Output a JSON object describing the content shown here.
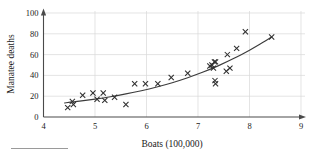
{
  "chart_data": {
    "type": "scatter",
    "title": "",
    "xlabel": "Boats (100,000)",
    "ylabel": "Manatee deaths",
    "xlim": [
      4,
      9
    ],
    "ylim": [
      0,
      100
    ],
    "xticks": [
      4,
      5,
      6,
      7,
      8,
      9
    ],
    "yticks": [
      0,
      20,
      40,
      60,
      80,
      100
    ],
    "xtick_labels": [
      "4",
      "5",
      "6",
      "7",
      "8",
      "9"
    ],
    "ytick_labels": [
      "0",
      "20",
      "40",
      "60",
      "80",
      "100"
    ],
    "grid": true,
    "legend": "none",
    "marker": "x",
    "marker_color": "#2e2e2e",
    "curve_color": "#3c3c3c",
    "grid_color": "#d8d8d8",
    "axis_color": "#4a4a4a",
    "points": [
      {
        "x": 4.47,
        "y": 9
      },
      {
        "x": 4.56,
        "y": 15
      },
      {
        "x": 4.58,
        "y": 12
      },
      {
        "x": 4.76,
        "y": 21
      },
      {
        "x": 4.96,
        "y": 23
      },
      {
        "x": 5.04,
        "y": 17
      },
      {
        "x": 5.16,
        "y": 23
      },
      {
        "x": 5.19,
        "y": 16
      },
      {
        "x": 5.38,
        "y": 19
      },
      {
        "x": 5.6,
        "y": 12
      },
      {
        "x": 5.77,
        "y": 32
      },
      {
        "x": 5.98,
        "y": 32
      },
      {
        "x": 6.22,
        "y": 32
      },
      {
        "x": 6.48,
        "y": 38
      },
      {
        "x": 6.8,
        "y": 42
      },
      {
        "x": 7.23,
        "y": 49
      },
      {
        "x": 7.27,
        "y": 50
      },
      {
        "x": 7.3,
        "y": 47
      },
      {
        "x": 7.32,
        "y": 53
      },
      {
        "x": 7.34,
        "y": 53
      },
      {
        "x": 7.33,
        "y": 35
      },
      {
        "x": 7.34,
        "y": 32
      },
      {
        "x": 7.55,
        "y": 44
      },
      {
        "x": 7.57,
        "y": 60
      },
      {
        "x": 7.62,
        "y": 47
      },
      {
        "x": 7.75,
        "y": 66
      },
      {
        "x": 7.92,
        "y": 82
      },
      {
        "x": 8.43,
        "y": 77
      }
    ],
    "fit_curve": {
      "label": "fitted curve",
      "points": [
        {
          "x": 4.4,
          "y": 13.5
        },
        {
          "x": 4.7,
          "y": 15.2
        },
        {
          "x": 5.0,
          "y": 17.2
        },
        {
          "x": 5.3,
          "y": 19.5
        },
        {
          "x": 5.6,
          "y": 22.2
        },
        {
          "x": 5.9,
          "y": 25.3
        },
        {
          "x": 6.2,
          "y": 28.9
        },
        {
          "x": 6.5,
          "y": 33.0
        },
        {
          "x": 6.8,
          "y": 37.8
        },
        {
          "x": 7.1,
          "y": 43.2
        },
        {
          "x": 7.4,
          "y": 49.4
        },
        {
          "x": 7.7,
          "y": 56.4
        },
        {
          "x": 8.0,
          "y": 64.3
        },
        {
          "x": 8.2,
          "y": 70.0
        },
        {
          "x": 8.43,
          "y": 77.0
        }
      ]
    }
  }
}
